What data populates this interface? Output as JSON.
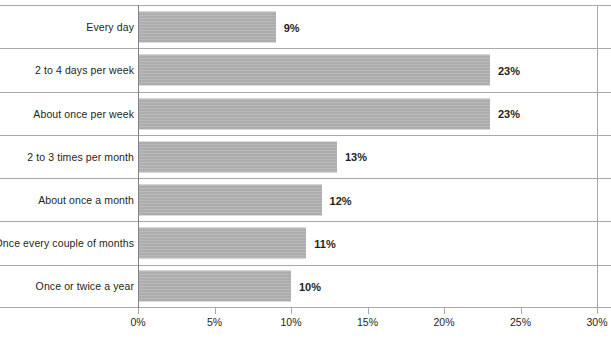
{
  "chart_data": {
    "type": "bar",
    "orientation": "horizontal",
    "title": "",
    "subtitle": "",
    "xlabel": "",
    "ylabel": "",
    "xlim": [
      0,
      30
    ],
    "xtick_labels": [
      "0%",
      "5%",
      "10%",
      "15%",
      "20%",
      "25%",
      "30%"
    ],
    "xticks": [
      0,
      5,
      10,
      15,
      20,
      25,
      30
    ],
    "grid": "horizontal-row-separators",
    "legend": "none",
    "bar_color": "#b3b3b3",
    "value_label_color": "#231f20",
    "axis_color": "#a7a9ac",
    "categories": [
      "Every day",
      "2 to 4 days per week",
      "About once per week",
      "2 to 3 times per month",
      "About once a month",
      "Once every couple of months",
      "Once or twice a year"
    ],
    "values": [
      9,
      23,
      23,
      13,
      12,
      11,
      10
    ],
    "value_labels": [
      "9%",
      "23%",
      "23%",
      "13%",
      "12%",
      "11%",
      "10%"
    ]
  }
}
